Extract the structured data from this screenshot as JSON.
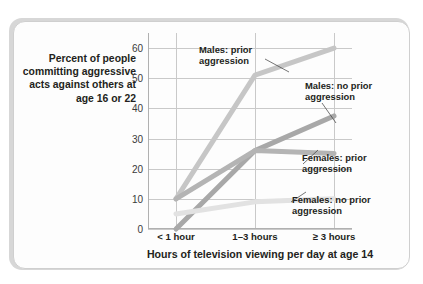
{
  "chart_data": {
    "type": "line",
    "title": "",
    "xlabel": "Hours of television viewing per day at age 14",
    "ylabel": "Percent of people committing aggressive acts against others at age 16 or 22",
    "categories": [
      "< 1 hour",
      "1–3 hours",
      "≥ 3 hours"
    ],
    "ylim": [
      0,
      65
    ],
    "yticks": [
      0,
      10,
      20,
      30,
      40,
      50,
      60
    ],
    "ytick_labels": [
      "0",
      "10",
      "20",
      "30",
      "40",
      "50",
      "60"
    ],
    "grid": "horizontal-and-vertical",
    "legend": "inline-annotations",
    "series": [
      {
        "name": "Males: prior aggression",
        "values": [
          10,
          51,
          60
        ],
        "color": "#c6c6c6"
      },
      {
        "name": "Males: no prior aggression",
        "values": [
          0,
          26,
          37.5
        ],
        "color": "#a8a8a8"
      },
      {
        "name": "Females: prior aggression",
        "values": [
          10,
          26,
          25
        ],
        "color": "#b4b4b4"
      },
      {
        "name": "Females: no prior aggression",
        "values": [
          5,
          9,
          10
        ],
        "color": "#e2e2e2"
      }
    ],
    "annotations": [
      {
        "id": "males-prior",
        "text": "Males: prior\naggression"
      },
      {
        "id": "males-noprior",
        "text": "Males: no prior\naggression"
      },
      {
        "id": "females-prior",
        "text": "Females: prior\naggression"
      },
      {
        "id": "females-noprior",
        "text": "Females: no prior\naggression"
      }
    ]
  },
  "axis": {
    "y_caption": "Percent of people committing aggressive acts against others at age 16 or 22",
    "x_caption": "Hours of television viewing per day at age 14"
  }
}
